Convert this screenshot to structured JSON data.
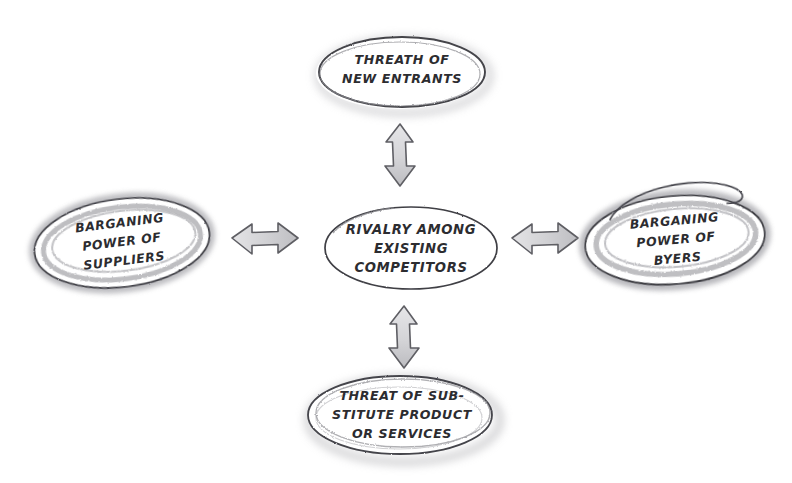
{
  "diagram": {
    "background_color": "#ffffff",
    "ink_color": "#3a3a3e",
    "smudge_color": "#9a9a9e",
    "arrow_fill": "#d8d8da",
    "arrow_stroke": "#6e6e73",
    "nodes": {
      "center": {
        "label": "RIVALRY AMONG EXISTING COMPETITORS",
        "lines": [
          "RIVALRY AMONG",
          "EXISTING",
          "COMPETITORS"
        ]
      },
      "top": {
        "label": "THREATH OF NEW ENTRANTS",
        "lines": [
          "THREATH OF",
          "NEW ENTRANTS"
        ]
      },
      "bottom": {
        "label": "THREAT OF SUB-STITUTE PRODUCT OR SERVICES",
        "lines": [
          "THREAT OF SUB-",
          "STITUTE PRODUCT",
          "OR SERVICES"
        ]
      },
      "left": {
        "label": "BARGANING POWER OF SUPPLIERS",
        "lines": [
          "BARGANING",
          "POWER OF",
          "SUPPLIERS"
        ]
      },
      "right": {
        "label": "BARGANING POWER OF BYERS",
        "lines": [
          "BARGANING",
          "POWER OF",
          "BYERS"
        ]
      }
    },
    "connectors": {
      "top": {
        "name": "double-arrow-vertical-top"
      },
      "bottom": {
        "name": "double-arrow-vertical-bottom"
      },
      "left": {
        "name": "double-arrow-horizontal-left"
      },
      "right": {
        "name": "double-arrow-horizontal-right"
      }
    }
  }
}
